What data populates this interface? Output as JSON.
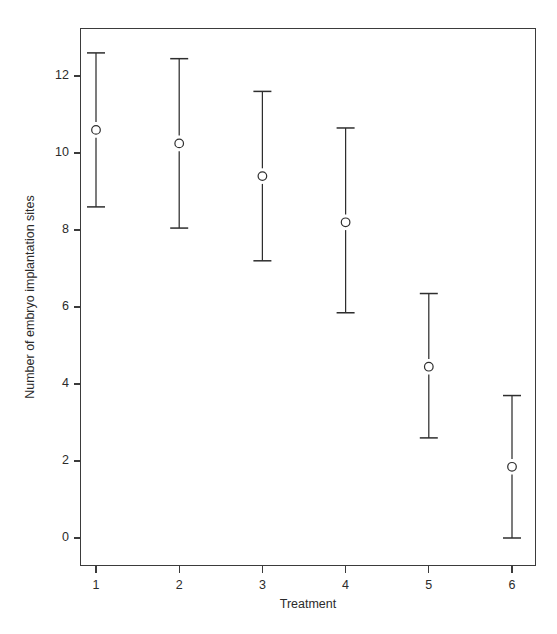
{
  "chart_data": {
    "type": "scatter",
    "title": "",
    "subtitle": "",
    "xlabel": "Treatment",
    "ylabel": "Number of embryo implantation sites",
    "categories": [
      "1",
      "2",
      "3",
      "4",
      "5",
      "6"
    ],
    "x": [
      1,
      2,
      3,
      4,
      5,
      6
    ],
    "values": [
      10.6,
      10.25,
      9.4,
      8.2,
      4.45,
      1.85
    ],
    "error_low": [
      8.6,
      8.05,
      7.2,
      5.85,
      2.6,
      0.0
    ],
    "error_high": [
      12.6,
      12.45,
      11.6,
      10.65,
      6.35,
      3.7
    ],
    "xlim": [
      0.55,
      6.45
    ],
    "ylim": [
      -0.35,
      13.0
    ],
    "xticks": [
      1,
      2,
      3,
      4,
      5,
      6
    ],
    "xticklabels": [
      "1",
      "2",
      "3",
      "4",
      "5",
      "6"
    ],
    "yticks": [
      0,
      2,
      4,
      6,
      8,
      10,
      12
    ],
    "yticklabels": [
      "0",
      "2",
      "4",
      "6",
      "8",
      "10",
      "12"
    ],
    "grid": false,
    "legend": null,
    "marker": "open-circle",
    "series": [
      {
        "name": "mean with error bars",
        "points": [
          {
            "x": 1,
            "mean": 10.6,
            "low": 8.6,
            "high": 12.6
          },
          {
            "x": 2,
            "mean": 10.25,
            "low": 8.05,
            "high": 12.45
          },
          {
            "x": 3,
            "mean": 9.4,
            "low": 7.2,
            "high": 11.6
          },
          {
            "x": 4,
            "mean": 8.2,
            "low": 5.85,
            "high": 10.65
          },
          {
            "x": 5,
            "mean": 4.45,
            "low": 2.6,
            "high": 6.35
          },
          {
            "x": 6,
            "mean": 1.85,
            "low": 0.0,
            "high": 3.7
          }
        ]
      }
    ],
    "colors": {
      "axis": "#3b3b3b",
      "marker_stroke": "#2e2e2e",
      "marker_fill": "#ffffff",
      "errorbar": "#2e2e2e",
      "background": "#ffffff",
      "text": "#2b2b2b"
    }
  },
  "figure": {
    "background": "#ffffff"
  }
}
